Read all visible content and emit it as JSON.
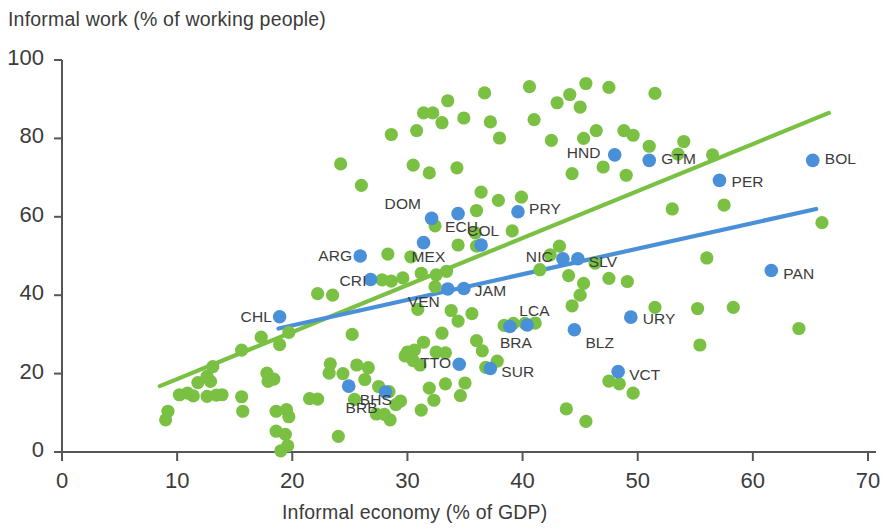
{
  "chart_data": {
    "type": "scatter",
    "title": "",
    "xlabel": "Informal economy (% of GDP)",
    "ylabel": "Informal work (% of working people)",
    "xlim": [
      0,
      70
    ],
    "ylim": [
      0,
      100
    ],
    "xticks": [
      0,
      10,
      20,
      30,
      40,
      50,
      60,
      70
    ],
    "yticks": [
      0,
      20,
      40,
      60,
      80,
      100
    ],
    "grid": false,
    "legend": "none",
    "colors": {
      "labeled_series": "#4a90d9",
      "unlabeled_series": "#7ac143",
      "axis": "#55565a",
      "text": "#3b3b3b",
      "background": "#ffffff"
    },
    "series": [
      {
        "name": "Latin America & Caribbean (labeled)",
        "color": "#4a90d9",
        "points": [
          {
            "code": "DOM",
            "x": 32.1,
            "y": 59.6,
            "label_dx": -45,
            "label_dy": -14
          },
          {
            "code": "ECU",
            "x": 34.4,
            "y": 60.8,
            "label_dx": -14,
            "label_dy": 13
          },
          {
            "code": "COL",
            "x": 36.4,
            "y": 52.8,
            "label_dx": -16,
            "label_dy": -14
          },
          {
            "code": "PRY",
            "x": 39.6,
            "y": 61.3,
            "label_dx": 11,
            "label_dy": -3
          },
          {
            "code": "MEX",
            "x": 31.4,
            "y": 53.4,
            "label_dx": -12,
            "label_dy": 14
          },
          {
            "code": "ARG",
            "x": 25.9,
            "y": 50.0,
            "label_dx": -42,
            "label_dy": 0
          },
          {
            "code": "CRI",
            "x": 26.8,
            "y": 44.0,
            "label_dx": -38,
            "label_dy": 1
          },
          {
            "code": "VEN",
            "x": 33.5,
            "y": 41.6,
            "label_dx": -42,
            "label_dy": 13
          },
          {
            "code": "JAM",
            "x": 34.9,
            "y": 41.7,
            "label_dx": 11,
            "label_dy": 2
          },
          {
            "code": "NIC",
            "x": 43.5,
            "y": 49.3,
            "label_dx": -44,
            "label_dy": -2
          },
          {
            "code": "SLV",
            "x": 44.8,
            "y": 49.3,
            "label_dx": 11,
            "label_dy": 3
          },
          {
            "code": "HND",
            "x": 48.0,
            "y": 75.8,
            "label_dx": -48,
            "label_dy": -2
          },
          {
            "code": "GTM",
            "x": 51.0,
            "y": 74.4,
            "label_dx": 12,
            "label_dy": -1
          },
          {
            "code": "PER",
            "x": 57.1,
            "y": 69.3,
            "label_dx": 12,
            "label_dy": 2
          },
          {
            "code": "BOL",
            "x": 65.2,
            "y": 74.4,
            "label_dx": 12,
            "label_dy": -1
          },
          {
            "code": "PAN",
            "x": 61.6,
            "y": 46.3,
            "label_dx": 12,
            "label_dy": 3
          },
          {
            "code": "URY",
            "x": 49.4,
            "y": 34.4,
            "label_dx": 12,
            "label_dy": 2
          },
          {
            "code": "BLZ",
            "x": 44.5,
            "y": 31.2,
            "label_dx": 11,
            "label_dy": 13
          },
          {
            "code": "LCA",
            "x": 40.4,
            "y": 32.4,
            "label_dx": -12,
            "label_dy": -14
          },
          {
            "code": "BRA",
            "x": 38.9,
            "y": 32.0,
            "label_dx": -12,
            "label_dy": 16
          },
          {
            "code": "SUR",
            "x": 37.2,
            "y": 21.3,
            "label_dx": 11,
            "label_dy": 3
          },
          {
            "code": "VCT",
            "x": 48.3,
            "y": 20.5,
            "label_dx": 11,
            "label_dy": 3
          },
          {
            "code": "TTO",
            "x": 34.5,
            "y": 22.4,
            "label_dx": -42,
            "label_dy": -1
          },
          {
            "code": "CHL",
            "x": 18.9,
            "y": 34.5,
            "label_dx": -42,
            "label_dy": 0
          },
          {
            "code": "BHS",
            "x": 24.9,
            "y": 16.8,
            "label_dx": 11,
            "label_dy": 14
          },
          {
            "code": "BRB",
            "x": 28.1,
            "y": 15.3,
            "label_dx": -42,
            "label_dy": 16
          }
        ]
      },
      {
        "name": "Other countries (unlabeled)",
        "color": "#7ac143",
        "points": [
          [
            40.6,
            93.2
          ],
          [
            45.5,
            94.0
          ],
          [
            44.1,
            91.2
          ],
          [
            45.0,
            88.0
          ],
          [
            43.0,
            89.1
          ],
          [
            36.7,
            91.6
          ],
          [
            33.5,
            89.6
          ],
          [
            32.2,
            86.5
          ],
          [
            31.4,
            86.5
          ],
          [
            33.0,
            84.0
          ],
          [
            30.8,
            82.0
          ],
          [
            28.6,
            81.0
          ],
          [
            34.9,
            85.2
          ],
          [
            37.2,
            84.2
          ],
          [
            38.0,
            80.1
          ],
          [
            41.0,
            84.8
          ],
          [
            47.5,
            93.0
          ],
          [
            51.5,
            91.5
          ],
          [
            48.8,
            82.0
          ],
          [
            46.4,
            82.0
          ],
          [
            45.3,
            80.0
          ],
          [
            42.5,
            79.5
          ],
          [
            49.6,
            80.8
          ],
          [
            51.0,
            78.0
          ],
          [
            53.5,
            76.0
          ],
          [
            54.0,
            79.2
          ],
          [
            56.5,
            75.8
          ],
          [
            47.0,
            72.7
          ],
          [
            49.0,
            70.6
          ],
          [
            44.3,
            71.0
          ],
          [
            30.5,
            73.2
          ],
          [
            24.2,
            73.5
          ],
          [
            31.9,
            71.2
          ],
          [
            34.3,
            72.5
          ],
          [
            57.5,
            63.0
          ],
          [
            56.0,
            49.5
          ],
          [
            66.0,
            58.5
          ],
          [
            53.0,
            62.0
          ],
          [
            49.6,
            15.0
          ],
          [
            48.4,
            17.4
          ],
          [
            26.0,
            68.0
          ],
          [
            36.4,
            66.3
          ],
          [
            37.9,
            64.2
          ],
          [
            39.9,
            65.0
          ],
          [
            36.0,
            61.6
          ],
          [
            32.4,
            57.7
          ],
          [
            39.1,
            56.4
          ],
          [
            35.9,
            55.9
          ],
          [
            36.0,
            52.5
          ],
          [
            34.4,
            52.8
          ],
          [
            30.3,
            49.8
          ],
          [
            28.3,
            50.5
          ],
          [
            27.8,
            43.9
          ],
          [
            28.6,
            43.6
          ],
          [
            29.6,
            44.4
          ],
          [
            31.2,
            45.6
          ],
          [
            32.5,
            45.2
          ],
          [
            33.4,
            46.1
          ],
          [
            32.4,
            42.2
          ],
          [
            42.4,
            50.3
          ],
          [
            43.2,
            52.5
          ],
          [
            41.5,
            46.5
          ],
          [
            44.0,
            45.0
          ],
          [
            45.3,
            43.0
          ],
          [
            46.3,
            48.2
          ],
          [
            47.5,
            44.3
          ],
          [
            49.1,
            43.5
          ],
          [
            45.0,
            40.0
          ],
          [
            44.3,
            37.3
          ],
          [
            51.5,
            36.9
          ],
          [
            55.2,
            36.6
          ],
          [
            58.3,
            36.9
          ],
          [
            64.0,
            31.5
          ],
          [
            55.4,
            27.3
          ],
          [
            40.2,
            32.8
          ],
          [
            38.4,
            32.3
          ],
          [
            47.5,
            18.1
          ],
          [
            43.8,
            11.0
          ],
          [
            45.5,
            7.8
          ],
          [
            22.2,
            40.4
          ],
          [
            23.5,
            40.0
          ],
          [
            30.9,
            36.4
          ],
          [
            33.8,
            36.1
          ],
          [
            35.6,
            35.3
          ],
          [
            34.4,
            33.4
          ],
          [
            36.0,
            28.4
          ],
          [
            33.0,
            30.3
          ],
          [
            31.4,
            28.0
          ],
          [
            30.0,
            25.5
          ],
          [
            19.7,
            30.5
          ],
          [
            18.9,
            27.4
          ],
          [
            17.3,
            29.3
          ],
          [
            15.6,
            26.0
          ],
          [
            13.1,
            21.8
          ],
          [
            12.6,
            19.3
          ],
          [
            12.9,
            18.0
          ],
          [
            11.8,
            17.7
          ],
          [
            10.9,
            15.0
          ],
          [
            10.2,
            14.6
          ],
          [
            11.4,
            14.3
          ],
          [
            12.6,
            14.2
          ],
          [
            13.4,
            14.5
          ],
          [
            13.9,
            14.6
          ],
          [
            9.2,
            10.4
          ],
          [
            9.0,
            8.2
          ],
          [
            15.6,
            14.1
          ],
          [
            15.7,
            10.4
          ],
          [
            17.8,
            20.1
          ],
          [
            17.9,
            18.0
          ],
          [
            18.4,
            18.6
          ],
          [
            18.6,
            10.4
          ],
          [
            19.5,
            10.8
          ],
          [
            19.7,
            9.0
          ],
          [
            18.6,
            5.3
          ],
          [
            19.4,
            4.5
          ],
          [
            19.6,
            1.6
          ],
          [
            19.0,
            0.3
          ],
          [
            21.5,
            13.6
          ],
          [
            22.2,
            13.5
          ],
          [
            23.3,
            22.5
          ],
          [
            23.2,
            20.1
          ],
          [
            26.3,
            18.5
          ],
          [
            27.5,
            16.7
          ],
          [
            25.4,
            13.4
          ],
          [
            28.4,
            15.4
          ],
          [
            24.0,
            4.0
          ],
          [
            29.8,
            24.5
          ],
          [
            30.6,
            26.0
          ],
          [
            30.5,
            23.3
          ],
          [
            31.1,
            22.2
          ],
          [
            32.5,
            25.5
          ],
          [
            33.3,
            25.3
          ],
          [
            31.9,
            16.3
          ],
          [
            32.3,
            13.2
          ],
          [
            31.2,
            10.7
          ],
          [
            33.3,
            17.4
          ],
          [
            29.4,
            13.0
          ],
          [
            29.0,
            12.1
          ],
          [
            27.3,
            9.7
          ],
          [
            28.0,
            9.6
          ],
          [
            28.5,
            8.2
          ],
          [
            25.6,
            22.2
          ],
          [
            36.5,
            25.8
          ],
          [
            37.8,
            23.2
          ],
          [
            39.2,
            32.8
          ],
          [
            41.1,
            32.9
          ],
          [
            36.8,
            21.6
          ],
          [
            35.0,
            17.6
          ],
          [
            34.6,
            14.4
          ],
          [
            25.2,
            30.0
          ],
          [
            26.6,
            21.5
          ],
          [
            24.4,
            20.0
          ]
        ]
      }
    ],
    "trendlines": [
      {
        "name": "unlabeled-trend",
        "color": "#7ac143",
        "x0": 8.5,
        "y0": 16.8,
        "x1": 66.6,
        "y1": 86.5
      },
      {
        "name": "labeled-trend",
        "color": "#4a90d9",
        "x0": 18.8,
        "y0": 31.5,
        "x1": 65.5,
        "y1": 62.0
      }
    ]
  }
}
